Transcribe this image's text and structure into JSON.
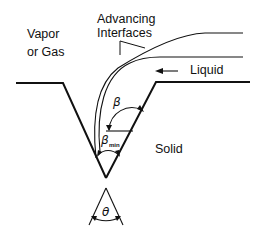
{
  "labels": {
    "vapor_line1": "Vapor",
    "vapor_line2": "or Gas",
    "interfaces_line1": "Advancing",
    "interfaces_line2": "Interfaces",
    "liquid": "Liquid",
    "solid": "Solid"
  },
  "angles": {
    "beta": "β",
    "beta_min": "β",
    "beta_min_subscript": "min",
    "theta": "θ"
  },
  "colors": {
    "stroke": "#111111",
    "background": "#ffffff"
  }
}
